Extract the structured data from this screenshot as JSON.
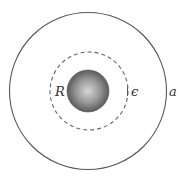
{
  "figure": {
    "type": "concentric-sphere-diagram",
    "labels": {
      "inner_radius": "R",
      "gap": "ϵ",
      "outer_radius": "a"
    },
    "elements": {
      "outer_circle": {
        "cx": 88,
        "cy": 91,
        "r": 78.5,
        "style": "solid"
      },
      "dashed_circle": {
        "cx": 89,
        "cy": 91,
        "r": 39,
        "style": "dashed"
      },
      "inner_sphere": {
        "cx": 88,
        "cy": 91,
        "r": 21,
        "style": "shaded"
      }
    },
    "colors": {
      "stroke": "#555555",
      "sphere_light": "#d4d4d4",
      "sphere_dark": "#5a5a5a",
      "label": "#333333"
    }
  }
}
